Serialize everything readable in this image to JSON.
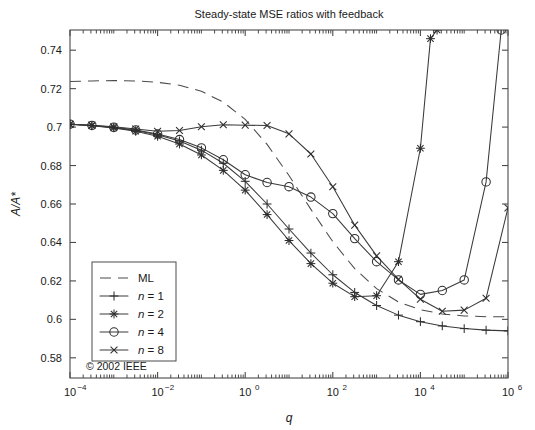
{
  "chart_data": {
    "type": "line",
    "title": "Steady-state MSE ratios with feedback",
    "xlabel": "q",
    "ylabel": "A/A*",
    "xscale": "log",
    "yscale": "linear",
    "xlim": [
      0.0001,
      1000000
    ],
    "ylim": [
      0.5695,
      0.7505
    ],
    "grid": false,
    "legend_position": "lower-left",
    "annotation": "© 2002 IEEE",
    "xticks": [
      0.0001,
      0.01,
      1,
      100,
      10000,
      1000000
    ],
    "xticklabels": [
      "10−4",
      "10−2",
      "10⁰",
      "10²",
      "10⁴",
      "10⁶"
    ],
    "xtick_mantissa": "10",
    "xtick_exponents": [
      "-4",
      "-2",
      "0",
      "2",
      "4",
      "6"
    ],
    "yticks": [
      0.58,
      0.6,
      0.62,
      0.64,
      0.66,
      0.68,
      0.7,
      0.72,
      0.74
    ],
    "yticklabels": [
      "0.58",
      "0.6",
      "0.62",
      "0.64",
      "0.66",
      "0.68",
      "0.7",
      "0.72",
      "0.74"
    ],
    "series": [
      {
        "name": "ML",
        "marker": "none",
        "linestyle": "dashed",
        "points": [
          [
            0.0001,
            0.7237
          ],
          [
            0.000316,
            0.724
          ],
          [
            0.001,
            0.7242
          ],
          [
            0.00316,
            0.724
          ],
          [
            0.01,
            0.7233
          ],
          [
            0.0316,
            0.7218
          ],
          [
            0.1,
            0.7186
          ],
          [
            0.316,
            0.713
          ],
          [
            1.0,
            0.704
          ],
          [
            3.16,
            0.691
          ],
          [
            10.0,
            0.6748
          ],
          [
            31.6,
            0.6572
          ],
          [
            100.0,
            0.6404
          ],
          [
            316.0,
            0.6264
          ],
          [
            1000.0,
            0.616
          ],
          [
            3160.0,
            0.609
          ],
          [
            10000.0,
            0.605
          ],
          [
            31600.0,
            0.6028
          ],
          [
            100000.0,
            0.6018
          ],
          [
            316000.0,
            0.6014
          ],
          [
            1000000.0,
            0.6013
          ]
        ]
      },
      {
        "name": "n = 1",
        "marker": "plus",
        "linestyle": "solid",
        "points": [
          [
            0.0001,
            0.7015
          ],
          [
            0.000316,
            0.7008
          ],
          [
            0.001,
            0.6997
          ],
          [
            0.00316,
            0.6982
          ],
          [
            0.01,
            0.696
          ],
          [
            0.0316,
            0.6928
          ],
          [
            0.1,
            0.688
          ],
          [
            0.316,
            0.6812
          ],
          [
            1.0,
            0.6718
          ],
          [
            3.16,
            0.66
          ],
          [
            10.0,
            0.647
          ],
          [
            31.6,
            0.6345
          ],
          [
            100.0,
            0.6232
          ],
          [
            316.0,
            0.614
          ],
          [
            1000.0,
            0.6072
          ],
          [
            3160.0,
            0.6022
          ],
          [
            10000.0,
            0.5988
          ],
          [
            31600.0,
            0.5966
          ],
          [
            100000.0,
            0.5952
          ],
          [
            316000.0,
            0.5944
          ],
          [
            1000000.0,
            0.594
          ]
        ]
      },
      {
        "name": "n = 2",
        "marker": "star",
        "linestyle": "solid",
        "points": [
          [
            0.0001,
            0.7015
          ],
          [
            0.000316,
            0.7007
          ],
          [
            0.001,
            0.6996
          ],
          [
            0.00316,
            0.6978
          ],
          [
            0.01,
            0.6952
          ],
          [
            0.0316,
            0.6912
          ],
          [
            0.1,
            0.6855
          ],
          [
            0.316,
            0.6775
          ],
          [
            1.0,
            0.6672
          ],
          [
            3.16,
            0.6545
          ],
          [
            10.0,
            0.641
          ],
          [
            31.6,
            0.629
          ],
          [
            100.0,
            0.6188
          ],
          [
            316.0,
            0.6118
          ],
          [
            1000.0,
            0.6123
          ],
          [
            3160.0,
            0.63
          ],
          [
            10000.0,
            0.689
          ],
          [
            17000.0,
            0.746
          ],
          [
            24000.0,
            0.7505
          ]
        ]
      },
      {
        "name": "n = 4",
        "marker": "circle",
        "linestyle": "solid",
        "points": [
          [
            0.0001,
            0.7015
          ],
          [
            0.000316,
            0.7009
          ],
          [
            0.001,
            0.6999
          ],
          [
            0.00316,
            0.6985
          ],
          [
            0.01,
            0.6964
          ],
          [
            0.0316,
            0.6935
          ],
          [
            0.1,
            0.6892
          ],
          [
            0.316,
            0.683
          ],
          [
            1.0,
            0.6752
          ],
          [
            3.16,
            0.6712
          ],
          [
            10.0,
            0.669
          ],
          [
            31.6,
            0.6636
          ],
          [
            100.0,
            0.655
          ],
          [
            316.0,
            0.642
          ],
          [
            1000.0,
            0.63
          ],
          [
            3160.0,
            0.6205
          ],
          [
            10000.0,
            0.613
          ],
          [
            31600.0,
            0.615
          ],
          [
            100000.0,
            0.6205
          ],
          [
            316000.0,
            0.6715
          ],
          [
            700000.0,
            0.7505
          ]
        ]
      },
      {
        "name": "n = 8",
        "marker": "x",
        "linestyle": "solid",
        "points": [
          [
            0.0001,
            0.7015
          ],
          [
            0.000316,
            0.701
          ],
          [
            0.001,
            0.7002
          ],
          [
            0.00316,
            0.699
          ],
          [
            0.01,
            0.6978
          ],
          [
            0.0316,
            0.6982
          ],
          [
            0.1,
            0.7002
          ],
          [
            0.316,
            0.7012
          ],
          [
            1.0,
            0.701
          ],
          [
            3.16,
            0.7008
          ],
          [
            10.0,
            0.6965
          ],
          [
            31.6,
            0.686
          ],
          [
            100.0,
            0.669
          ],
          [
            316.0,
            0.649
          ],
          [
            1000.0,
            0.633
          ],
          [
            3160.0,
            0.6208
          ],
          [
            10000.0,
            0.6105
          ],
          [
            31600.0,
            0.6042
          ],
          [
            100000.0,
            0.6048
          ],
          [
            316000.0,
            0.611
          ],
          [
            1000000.0,
            0.658
          ]
        ]
      }
    ]
  },
  "legend": {
    "entries": [
      {
        "label": "ML",
        "marker": "none",
        "style": "dashed"
      },
      {
        "label": "n = 1",
        "marker": "plus",
        "style": "solid"
      },
      {
        "label": "n = 2",
        "marker": "star",
        "style": "solid"
      },
      {
        "label": "n = 4",
        "marker": "circle",
        "style": "solid"
      },
      {
        "label": "n = 8",
        "marker": "x",
        "style": "solid"
      }
    ]
  },
  "colors": {
    "background": "#ffffff",
    "axis": "#4a4a4a",
    "curve": "#3a3a3a"
  }
}
